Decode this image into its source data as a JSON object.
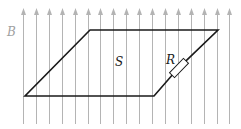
{
  "diagram": {
    "type": "physics-magnetic-field-loop",
    "labels": {
      "field": "B",
      "area": "S",
      "resistor": "R"
    },
    "colors": {
      "field_lines": "#b4b4b4",
      "loop": "#1a1a1a",
      "field_label": "#a0a0a0",
      "text": "#1a1a1a"
    },
    "field_lines": {
      "count": 17,
      "x_start": 23,
      "x_step": 12.9,
      "y_top": 8,
      "y_bottom": 124,
      "direction": "up"
    },
    "loop": {
      "shape": "parallelogram",
      "points": [
        [
          90,
          30
        ],
        [
          218,
          30
        ],
        [
          154,
          96
        ],
        [
          25,
          96
        ]
      ]
    },
    "resistor": {
      "on_edge": "right",
      "center": [
        179,
        68
      ]
    }
  }
}
